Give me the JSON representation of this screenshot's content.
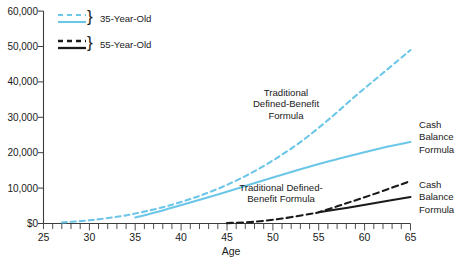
{
  "chart_data": {
    "type": "line",
    "title": "",
    "xlabel": "Age",
    "ylabel": "",
    "xlim": [
      25,
      65
    ],
    "ylim": [
      0,
      60000
    ],
    "grid": false,
    "x_tick_labels": [
      "25",
      "30",
      "35",
      "40",
      "45",
      "50",
      "55",
      "60",
      "65"
    ],
    "x_tick_values": [
      25,
      30,
      35,
      40,
      45,
      50,
      55,
      60,
      65
    ],
    "x_minor_tick_step": 1,
    "y_tick_labels": [
      "$0",
      "10,000",
      "20,000",
      "30,000",
      "40,000",
      "50,000",
      "60,000"
    ],
    "y_tick_values": [
      0,
      10000,
      20000,
      30000,
      40000,
      50000,
      60000
    ],
    "legend_position": "top-left",
    "colors": {
      "blue": "#6bc6e8",
      "black": "#1a1a1a",
      "axis": "#3c3c3c",
      "background": "#ffffff"
    },
    "series": [
      {
        "name": "35-Year-Old Traditional Defined-Benefit Formula",
        "group": "35-Year-Old",
        "formula": "Traditional Defined-Benefit",
        "color": "#6bc6e8",
        "style": "dashed",
        "x": [
          27,
          30,
          33,
          35,
          38,
          41,
          44,
          47,
          50,
          53,
          56,
          59,
          62,
          65
        ],
        "values": [
          300,
          900,
          1900,
          2800,
          4600,
          6900,
          9800,
          13400,
          17800,
          23000,
          29200,
          36000,
          42500,
          49000
        ]
      },
      {
        "name": "35-Year-Old Cash Balance Formula",
        "group": "35-Year-Old",
        "formula": "Cash Balance",
        "color": "#6bc6e8",
        "style": "solid",
        "x": [
          35,
          38,
          41,
          44,
          47,
          50,
          53,
          56,
          59,
          62,
          65
        ],
        "values": [
          1700,
          3700,
          5900,
          8200,
          10600,
          13000,
          15300,
          17500,
          19500,
          21400,
          23000
        ]
      },
      {
        "name": "55-Year-Old Traditional Defined-Benefit Formula",
        "group": "55-Year-Old",
        "formula": "Traditional Defined-Benefit",
        "color": "#1a1a1a",
        "style": "dashed",
        "x": [
          45,
          48,
          51,
          54,
          55,
          58,
          61,
          65
        ],
        "values": [
          100,
          500,
          1400,
          2700,
          3200,
          5700,
          8300,
          12000
        ]
      },
      {
        "name": "55-Year-Old Cash Balance Formula",
        "group": "55-Year-Old",
        "formula": "Cash Balance",
        "color": "#1a1a1a",
        "style": "solid",
        "x": [
          55,
          58,
          61,
          65
        ],
        "values": [
          3200,
          4400,
          5700,
          7500
        ]
      }
    ],
    "annotations": [
      {
        "id": "traditional-db-upper",
        "lines": [
          "Traditional",
          "Defined-Benefit",
          "Formula"
        ],
        "x": 57,
        "y": 33000
      },
      {
        "id": "traditional-db-lower",
        "lines": [
          "Traditional Defined-",
          "Benefit Formula"
        ],
        "x": 54,
        "y": 9500
      },
      {
        "id": "cash-balance-upper",
        "lines": [
          "Cash",
          "Balance",
          "Formula"
        ],
        "x": 66,
        "y": 25000
      },
      {
        "id": "cash-balance-lower",
        "lines": [
          "Cash",
          "Balance",
          "Formula"
        ],
        "x": 66,
        "y": 8500
      }
    ]
  },
  "legend": {
    "brace": "}",
    "entries": [
      {
        "label": "35-Year-Old",
        "color": "#6bc6e8",
        "dashed_over_solid": true
      },
      {
        "label": "55-Year-Old",
        "color": "#1a1a1a",
        "dashed_over_solid": true
      }
    ]
  },
  "axis": {
    "x_title": "Age"
  }
}
